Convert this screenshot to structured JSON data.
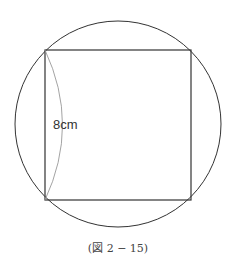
{
  "figure": {
    "side_label": "8cm",
    "caption": "(図 2 − 15)",
    "colors": {
      "stroke": "#333333",
      "arc": "#999999",
      "background": "#ffffff"
    }
  }
}
